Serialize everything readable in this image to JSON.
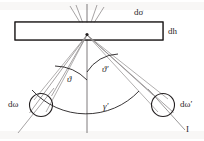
{
  "figure": {
    "title_alt": "Scattering geometry diagram",
    "background_color": "#ffffff",
    "ink_color": "#231f20",
    "faint_ink_color": "#8f8c8d",
    "width": 204,
    "height": 141,
    "labels": {
      "d_sigma": "dσ",
      "d_h": "dh",
      "d_omega": "dω",
      "d_omega_prime": "dω′",
      "theta": "ϑ",
      "theta_prime": "ϑ′",
      "gamma_prime": "γ′",
      "beam_I": "I"
    },
    "elements": {
      "slab_name": "target-slab",
      "apex_name": "scattering-vertex",
      "left_cone_name": "left-solid-angle-cone",
      "right_cone_name": "right-solid-angle-cone",
      "left_circle_name": "left-detector-aperture",
      "right_circle_name": "right-detector-aperture",
      "vertical_axis_name": "vertical-reference-axis",
      "theta_arc_name": "theta-angle-arc",
      "theta_prime_arc_name": "theta-prime-angle-arc",
      "gamma_arc_name": "gamma-prime-angle-arc",
      "incident_beam_name": "incident-beam-line"
    },
    "geometry": {
      "apex": {
        "x": 87,
        "y": 34
      },
      "slab": {
        "x": 15,
        "y": 22,
        "width": 148,
        "height": 18
      },
      "left_circle": {
        "cx": 41,
        "cy": 105,
        "r": 11.5
      },
      "right_circle": {
        "cx": 163,
        "cy": 105,
        "r": 11.5
      }
    }
  }
}
